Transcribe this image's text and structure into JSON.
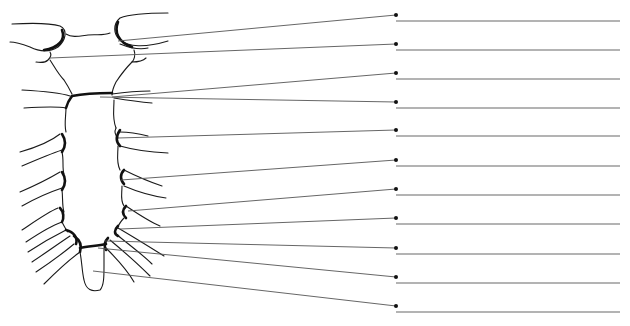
{
  "diagram": {
    "type": "unlabeled-anatomical-line-drawing",
    "label_count": 11,
    "colors": {
      "drawing": "#1a1a1a",
      "leader_line": "#555555",
      "answer_line": "#9a9a9a",
      "dot": "#111111",
      "background": "#ffffff"
    },
    "labels": [
      {
        "index": 1,
        "text": "",
        "target": [
          118,
          41
        ],
        "dot": [
          396,
          15
        ]
      },
      {
        "index": 2,
        "text": "",
        "target": [
          50,
          58
        ],
        "dot": [
          396,
          44
        ]
      },
      {
        "index": 3,
        "text": "",
        "target": [
          112,
          97
        ],
        "dot": [
          396,
          73
        ]
      },
      {
        "index": 4,
        "text": "",
        "target": [
          100,
          97
        ],
        "dot": [
          396,
          102
        ]
      },
      {
        "index": 5,
        "text": "",
        "target": [
          118,
          138
        ],
        "dot": [
          396,
          130
        ]
      },
      {
        "index": 6,
        "text": "",
        "target": [
          121,
          180
        ],
        "dot": [
          396,
          160
        ]
      },
      {
        "index": 7,
        "text": "",
        "target": [
          128,
          211
        ],
        "dot": [
          396,
          189
        ]
      },
      {
        "index": 8,
        "text": "",
        "target": [
          120,
          229
        ],
        "dot": [
          396,
          218
        ]
      },
      {
        "index": 9,
        "text": "",
        "target": [
          105,
          241
        ],
        "dot": [
          396,
          248
        ]
      },
      {
        "index": 10,
        "text": "",
        "target": [
          98,
          248
        ],
        "dot": [
          396,
          277
        ]
      },
      {
        "index": 11,
        "text": "",
        "target": [
          93,
          271
        ],
        "dot": [
          396,
          306
        ]
      }
    ],
    "answer_line": {
      "x1": 396,
      "x2": 620,
      "offset_y": 6
    }
  }
}
